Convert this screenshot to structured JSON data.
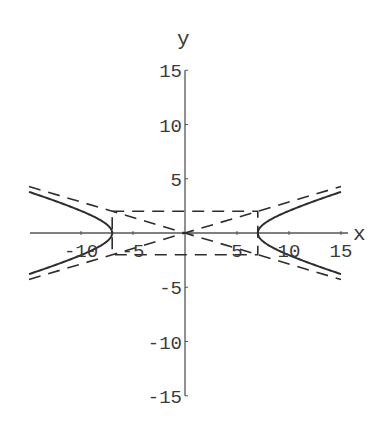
{
  "chart_data": {
    "type": "line",
    "title": "",
    "xlabel": "x",
    "ylabel": "y",
    "xlim": [
      -15,
      15
    ],
    "ylim": [
      -15,
      15
    ],
    "x_ticks": [
      -10,
      -5,
      5,
      10,
      15
    ],
    "y_ticks": [
      15,
      10,
      5,
      -5,
      -10,
      -15
    ],
    "x_tick_labels": [
      "-10",
      "-5",
      "5",
      "10",
      "15"
    ],
    "y_tick_labels": [
      "15",
      "10",
      "5",
      "-5",
      "-10",
      "-15"
    ],
    "grid": false,
    "legend": null,
    "series": [
      {
        "name": "hyperbola x^2/49 - y^2/4 = 1",
        "style": "solid",
        "equation": "x^2/49 - y^2/4 = 1",
        "a": 7,
        "b": 2,
        "x_range": [
          -15,
          15
        ],
        "sample_points": [
          [
            7,
            0
          ],
          [
            8,
            0.97
          ],
          [
            10,
            2.04
          ],
          [
            12,
            2.79
          ],
          [
            15,
            3.79
          ],
          [
            -7,
            0
          ],
          [
            -10,
            2.04
          ],
          [
            -15,
            3.79
          ],
          [
            -15,
            -3.79
          ],
          [
            15,
            -3.79
          ]
        ]
      },
      {
        "name": "asymptote y = (2/7)x",
        "style": "dashed",
        "equation": "y = 2x/7",
        "x_range": [
          -15,
          15
        ]
      },
      {
        "name": "asymptote y = -(2/7)x",
        "style": "dashed",
        "equation": "y = -2x/7",
        "x_range": [
          -15,
          15
        ]
      },
      {
        "name": "central rectangle",
        "style": "dashed",
        "corners": [
          [
            -7,
            2
          ],
          [
            7,
            2
          ],
          [
            7,
            -2
          ],
          [
            -7,
            -2
          ]
        ]
      }
    ]
  },
  "axes": {
    "x_label": "x",
    "y_label": "y"
  },
  "colors": {
    "curve": "#2e2e2e",
    "axis": "#555555",
    "text": "#3a3a3a",
    "background": "#ffffff"
  }
}
